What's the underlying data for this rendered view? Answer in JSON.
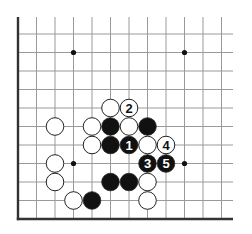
{
  "diagram": {
    "type": "go-board-fragment",
    "columns": 12,
    "rows": 11,
    "edges": [
      "left",
      "bottom"
    ],
    "colors": {
      "line": "#9a9a9a",
      "edge": "#333333",
      "black_stone": "#111111",
      "white_stone": "#ffffff",
      "stone_outline": "#222222"
    },
    "star_points": [
      {
        "col": 3,
        "row": 1
      },
      {
        "col": 9,
        "row": 1
      },
      {
        "col": 3,
        "row": 7
      },
      {
        "col": 9,
        "row": 7
      }
    ],
    "stones": [
      {
        "color": "white",
        "col": 5,
        "row": 4,
        "label": ""
      },
      {
        "color": "white",
        "col": 6,
        "row": 4,
        "label": "2"
      },
      {
        "color": "white",
        "col": 2,
        "row": 5,
        "label": ""
      },
      {
        "color": "white",
        "col": 4,
        "row": 5,
        "label": ""
      },
      {
        "color": "black",
        "col": 5,
        "row": 5,
        "label": ""
      },
      {
        "color": "white",
        "col": 6,
        "row": 5,
        "label": ""
      },
      {
        "color": "black",
        "col": 7,
        "row": 5,
        "label": ""
      },
      {
        "color": "white",
        "col": 4,
        "row": 6,
        "label": ""
      },
      {
        "color": "black",
        "col": 5,
        "row": 6,
        "label": ""
      },
      {
        "color": "black",
        "col": 6,
        "row": 6,
        "label": "1"
      },
      {
        "color": "white",
        "col": 7,
        "row": 6,
        "label": ""
      },
      {
        "color": "white",
        "col": 8,
        "row": 6,
        "label": "4"
      },
      {
        "color": "white",
        "col": 2,
        "row": 7,
        "label": ""
      },
      {
        "color": "black",
        "col": 7,
        "row": 7,
        "label": "3"
      },
      {
        "color": "black",
        "col": 8,
        "row": 7,
        "label": "5"
      },
      {
        "color": "white",
        "col": 2,
        "row": 8,
        "label": ""
      },
      {
        "color": "black",
        "col": 5,
        "row": 8,
        "label": ""
      },
      {
        "color": "black",
        "col": 6,
        "row": 8,
        "label": ""
      },
      {
        "color": "white",
        "col": 7,
        "row": 8,
        "label": ""
      },
      {
        "color": "white",
        "col": 3,
        "row": 9,
        "label": ""
      },
      {
        "color": "black",
        "col": 4,
        "row": 9,
        "label": ""
      },
      {
        "color": "white",
        "col": 7,
        "row": 9,
        "label": ""
      }
    ]
  }
}
